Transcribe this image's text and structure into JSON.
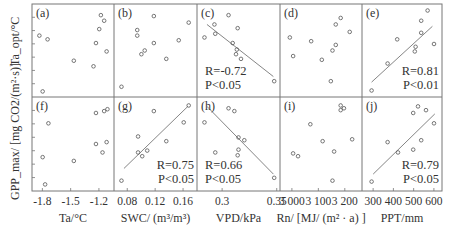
{
  "chart_data": {
    "type": "scatter",
    "layout": "2x5 grid",
    "ylabel_top_row": "Ta_opt/°C",
    "ylabel_bottom_row": "GPP_max/ [mg CO2/(m²·s)]",
    "y_ticks_labeled": false,
    "columns": [
      {
        "xlabel": "Ta/°C",
        "x_ticks": [
          "-1.8",
          "-1.5",
          "-1.2"
        ],
        "tick_values": [
          -1.8,
          -1.5,
          -1.2
        ],
        "xlim": [
          -1.91,
          -1.04
        ]
      },
      {
        "xlabel": "SWC/ (m³/m³)",
        "x_ticks": [
          "0.08",
          "0.12",
          "0.16"
        ],
        "tick_values": [
          0.08,
          0.12,
          0.16
        ],
        "xlim": [
          0.061,
          0.18
        ]
      },
      {
        "xlabel": "VPD/kPa",
        "x_ticks": [
          "0.3",
          "0.35"
        ],
        "tick_values": [
          0.3,
          0.35
        ],
        "xlim": [
          0.277,
          0.353
        ]
      },
      {
        "xlabel": "Rn/ [MJ/ (m² · a) ]",
        "x_ticks": [
          "3 000",
          "3 100",
          "3 200"
        ],
        "tick_values": [
          3000,
          3100,
          3200
        ],
        "xlim": [
          2955,
          3265
        ]
      },
      {
        "xlabel": "PPT/mm",
        "x_ticks": [
          "300",
          "400",
          "500",
          "600"
        ],
        "tick_values": [
          300,
          400,
          500,
          600
        ],
        "xlim": [
          245,
          640
        ]
      }
    ],
    "panels": [
      {
        "id": "a",
        "label": "(a)",
        "row": 0,
        "col": 0,
        "fit": null,
        "R": null,
        "P": null,
        "points_norm": [
          [
            0.84,
            0.88
          ],
          [
            0.88,
            0.82
          ],
          [
            0.82,
            0.73
          ],
          [
            0.09,
            0.66
          ],
          [
            0.19,
            0.62
          ],
          [
            0.78,
            0.58
          ],
          [
            0.91,
            0.49
          ],
          [
            0.51,
            0.39
          ],
          [
            0.75,
            0.33
          ],
          [
            0.13,
            0.06
          ]
        ]
      },
      {
        "id": "b",
        "label": "(b)",
        "row": 0,
        "col": 1,
        "fit": null,
        "R": null,
        "P": null,
        "points_norm": [
          [
            0.48,
            0.87
          ],
          [
            0.9,
            0.8
          ],
          [
            0.28,
            0.72
          ],
          [
            0.28,
            0.66
          ],
          [
            0.78,
            0.61
          ],
          [
            0.48,
            0.58
          ],
          [
            0.37,
            0.5
          ],
          [
            0.33,
            0.46
          ],
          [
            0.63,
            0.41
          ],
          [
            0.09,
            0.11
          ]
        ]
      },
      {
        "id": "c",
        "label": "(c)",
        "row": 0,
        "col": 2,
        "fit": [
          [
            0.12,
            0.78
          ],
          [
            0.92,
            0.22
          ]
        ],
        "R": "R=-0.72",
        "P": "P<0.05",
        "points_norm": [
          [
            0.38,
            0.88
          ],
          [
            0.21,
            0.78
          ],
          [
            0.49,
            0.74
          ],
          [
            0.09,
            0.64
          ],
          [
            0.22,
            0.68
          ],
          [
            0.43,
            0.58
          ],
          [
            0.48,
            0.51
          ],
          [
            0.47,
            0.46
          ],
          [
            0.53,
            0.41
          ],
          [
            0.93,
            0.17
          ]
        ]
      },
      {
        "id": "d",
        "label": "(d)",
        "row": 0,
        "col": 3,
        "fit": null,
        "R": null,
        "P": null,
        "points_norm": [
          [
            0.74,
            0.85
          ],
          [
            0.68,
            0.78
          ],
          [
            0.85,
            0.7
          ],
          [
            0.12,
            0.64
          ],
          [
            0.38,
            0.6
          ],
          [
            0.68,
            0.56
          ],
          [
            0.64,
            0.5
          ],
          [
            0.16,
            0.44
          ],
          [
            0.51,
            0.4
          ],
          [
            0.62,
            0.17
          ]
        ]
      },
      {
        "id": "e",
        "label": "(e)",
        "row": 0,
        "col": 4,
        "fit": [
          [
            0.12,
            0.16
          ],
          [
            0.88,
            0.76
          ]
        ],
        "R": "R=0.81",
        "P": "P<0.01",
        "points_norm": [
          [
            0.82,
            0.93
          ],
          [
            0.74,
            0.82
          ],
          [
            0.74,
            0.69
          ],
          [
            0.44,
            0.62
          ],
          [
            0.9,
            0.57
          ],
          [
            0.67,
            0.54
          ],
          [
            0.66,
            0.49
          ],
          [
            0.32,
            0.36
          ],
          [
            0.12,
            0.07
          ]
        ]
      },
      {
        "id": "f",
        "label": "(f)",
        "row": 1,
        "col": 0,
        "fit": null,
        "R": null,
        "P": null,
        "points_norm": [
          [
            0.78,
            0.83
          ],
          [
            0.88,
            0.85
          ],
          [
            0.92,
            0.87
          ],
          [
            0.2,
            0.72
          ],
          [
            0.91,
            0.52
          ],
          [
            0.78,
            0.5
          ],
          [
            0.86,
            0.41
          ],
          [
            0.13,
            0.36
          ],
          [
            0.51,
            0.32
          ],
          [
            0.16,
            0.07
          ]
        ]
      },
      {
        "id": "g",
        "label": "(g)",
        "row": 1,
        "col": 1,
        "fit": [
          [
            0.12,
            0.24
          ],
          [
            0.89,
            0.9
          ]
        ],
        "R": "R=0.75",
        "P": "P<0.05",
        "points_norm": [
          [
            0.9,
            0.91
          ],
          [
            0.48,
            0.85
          ],
          [
            0.84,
            0.73
          ],
          [
            0.29,
            0.58
          ],
          [
            0.63,
            0.53
          ],
          [
            0.29,
            0.41
          ],
          [
            0.4,
            0.43
          ],
          [
            0.34,
            0.37
          ],
          [
            0.09,
            0.11
          ]
        ]
      },
      {
        "id": "h",
        "label": "(h)",
        "row": 1,
        "col": 2,
        "fit": [
          [
            0.12,
            0.9
          ],
          [
            0.92,
            0.18
          ]
        ],
        "R": "R=0.66",
        "P": "P<0.05",
        "points_norm": [
          [
            0.38,
            0.88
          ],
          [
            0.45,
            0.85
          ],
          [
            0.09,
            0.73
          ],
          [
            0.5,
            0.57
          ],
          [
            0.57,
            0.54
          ],
          [
            0.22,
            0.41
          ],
          [
            0.5,
            0.44
          ],
          [
            0.49,
            0.38
          ],
          [
            0.93,
            0.14
          ]
        ]
      },
      {
        "id": "i",
        "label": "(i)",
        "row": 1,
        "col": 3,
        "fit": null,
        "R": null,
        "P": null,
        "points_norm": [
          [
            0.74,
            0.91
          ],
          [
            0.78,
            0.88
          ],
          [
            0.74,
            0.86
          ],
          [
            0.37,
            0.71
          ],
          [
            0.88,
            0.55
          ],
          [
            0.52,
            0.53
          ],
          [
            0.66,
            0.42
          ],
          [
            0.16,
            0.4
          ],
          [
            0.22,
            0.37
          ],
          [
            0.64,
            0.11
          ]
        ]
      },
      {
        "id": "j",
        "label": "(j)",
        "row": 1,
        "col": 4,
        "fit": [
          [
            0.14,
            0.18
          ],
          [
            0.91,
            0.82
          ]
        ],
        "R": "R=0.79",
        "P": "P<0.05",
        "points_norm": [
          [
            0.7,
            0.9
          ],
          [
            0.8,
            0.86
          ],
          [
            0.64,
            0.83
          ],
          [
            0.9,
            0.72
          ],
          [
            0.74,
            0.54
          ],
          [
            0.32,
            0.52
          ],
          [
            0.45,
            0.41
          ],
          [
            0.64,
            0.44
          ],
          [
            0.12,
            0.1
          ]
        ]
      }
    ]
  }
}
